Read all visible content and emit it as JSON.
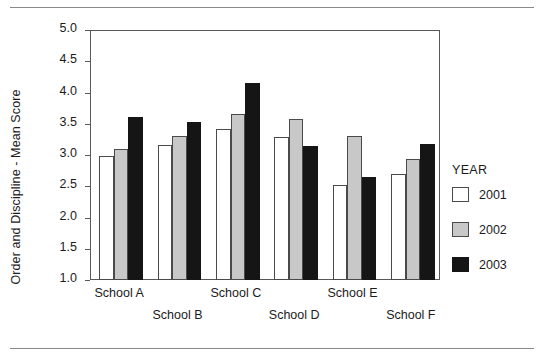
{
  "chart_data": {
    "type": "bar",
    "title": "",
    "xlabel": "",
    "ylabel": "Order and Discipline - Mean Score",
    "ylim": [
      1.0,
      5.0
    ],
    "ytick_labels": [
      "5.0",
      "4.5",
      "4.0",
      "3.5",
      "3.0",
      "2.5",
      "2.0",
      "1.5",
      "1.0"
    ],
    "yticks": [
      5.0,
      4.5,
      4.0,
      3.5,
      3.0,
      2.5,
      2.0,
      1.5,
      1.0
    ],
    "grid": false,
    "legend_position": "right",
    "legend_title": "YEAR",
    "categories": [
      "School A",
      "School B",
      "School C",
      "School D",
      "School E",
      "School F"
    ],
    "series": [
      {
        "name": "2001",
        "color": "#ffffff",
        "values": [
          2.98,
          3.16,
          3.42,
          3.29,
          2.52,
          2.69
        ]
      },
      {
        "name": "2002",
        "color": "#c8c8c8",
        "values": [
          3.1,
          3.3,
          3.66,
          3.57,
          3.31,
          2.93
        ]
      },
      {
        "name": "2003",
        "color": "#151515",
        "values": [
          3.61,
          3.53,
          4.15,
          3.15,
          2.65,
          3.17
        ]
      }
    ]
  },
  "axis": {
    "y_title": "Order and Discipline - Mean Score",
    "ticks": [
      "5.0",
      "4.5",
      "4.0",
      "3.5",
      "3.0",
      "2.5",
      "2.0",
      "1.5",
      "1.0"
    ]
  },
  "x_labels": [
    {
      "text": "School A",
      "row": "a"
    },
    {
      "text": "School B",
      "row": "b"
    },
    {
      "text": "School C",
      "row": "a"
    },
    {
      "text": "School D",
      "row": "b"
    },
    {
      "text": "School E",
      "row": "a"
    },
    {
      "text": "School F",
      "row": "b"
    }
  ],
  "legend": {
    "title": "YEAR",
    "items": [
      {
        "label": "2001",
        "swatch": "white-swatch"
      },
      {
        "label": "2002",
        "swatch": "gray-swatch"
      },
      {
        "label": "2003",
        "swatch": "black-swatch"
      }
    ]
  }
}
